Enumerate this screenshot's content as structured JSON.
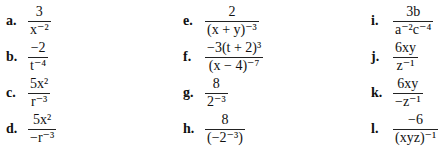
{
  "problems": [
    {
      "label": "a.",
      "num": "3",
      "den": "x⁻²"
    },
    {
      "label": "b.",
      "num": "−2",
      "den": "t⁻⁴"
    },
    {
      "label": "c.",
      "num": "5x²",
      "den": "r⁻³"
    },
    {
      "label": "d.",
      "num": "5x²",
      "den": "−r⁻³"
    },
    {
      "label": "e.",
      "num": "2",
      "den": "(x + y)⁻³"
    },
    {
      "label": "f.",
      "num": "−3(t + 2)³",
      "den": "(x − 4)⁻⁷"
    },
    {
      "label": "g.",
      "num": "8",
      "den": "2⁻³"
    },
    {
      "label": "h.",
      "num": "8",
      "den": "(−2⁻³)"
    },
    {
      "label": "i.",
      "num": "3b",
      "den": "a⁻²c⁻⁴"
    },
    {
      "label": "j.",
      "num": "6xy",
      "den": "z⁻¹"
    },
    {
      "label": "k.",
      "num": "6xy",
      "den": "−z⁻¹"
    },
    {
      "label": "l.",
      "num": "−6",
      "den": "(xyz)⁻¹"
    }
  ]
}
